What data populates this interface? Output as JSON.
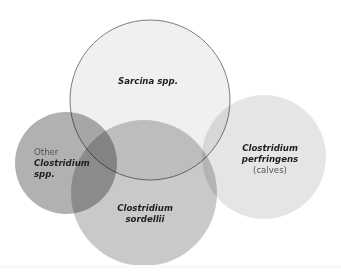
{
  "diagram": {
    "type": "venn",
    "circles": [
      {
        "id": "perfringens",
        "cx": 264,
        "cy": 157,
        "r": 62,
        "fill": "#e4e4e4",
        "lines": [
          {
            "text": "Clostridium",
            "style": "bold-italic"
          },
          {
            "text": "perfringens",
            "style": "bold-italic"
          },
          {
            "text": "(calves)",
            "style": "regular"
          }
        ]
      },
      {
        "id": "sordellii",
        "cx": 144,
        "cy": 193,
        "r": 73,
        "fill": "#c4c4c4",
        "lines": [
          {
            "text": "Clostridium",
            "style": "bold-italic"
          },
          {
            "text": "sordellii",
            "style": "bold-italic"
          }
        ]
      },
      {
        "id": "other-clostridium",
        "cx": 66,
        "cy": 163,
        "r": 51,
        "fill": "#a8a8a8",
        "lines": [
          {
            "text": "Other",
            "style": "regular"
          },
          {
            "text": "Clostridium",
            "style": "bold-italic"
          },
          {
            "text": "spp.",
            "style": "bold-italic"
          }
        ]
      },
      {
        "id": "sarcina",
        "cx": 150,
        "cy": 100,
        "r": 80,
        "fill": "#ebebeb",
        "stroke": "#6e6e6e",
        "lines": [
          {
            "text": "Sarcina spp.",
            "style": "bold-italic"
          }
        ]
      }
    ]
  },
  "labels": {
    "sarcina": {
      "line1": "Sarcina spp."
    },
    "other": {
      "line1": "Other",
      "line2": "Clostridium",
      "line3": "spp."
    },
    "sordellii": {
      "line1": "Clostridium",
      "line2": "sordellii"
    },
    "perfringens": {
      "line1": "Clostridium",
      "line2": "perfringens",
      "line3": "(calves)"
    }
  }
}
